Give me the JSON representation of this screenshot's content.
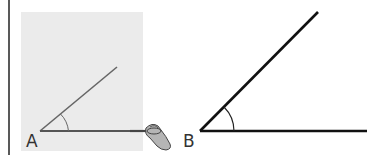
{
  "figure": {
    "left_panel": {
      "background": "#ebebeb",
      "vertex_label": "A",
      "ray_color": "#666666",
      "description": "angle drawn on gray paper with a pen tracing the base ray"
    },
    "right_panel": {
      "vertex_label": "B",
      "ray_color": "#111111",
      "description": "copied angle drawn in bold black lines"
    },
    "colors": {
      "margin_line": "#222222",
      "hand": "#9a9a9a"
    }
  }
}
